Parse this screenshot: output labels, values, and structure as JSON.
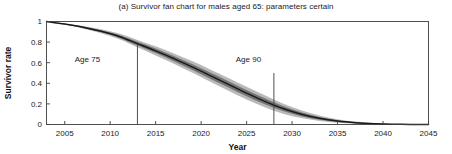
{
  "chart_data": {
    "type": "area",
    "title": "(a) Survivor fan chart for males aged 65: parameters certain",
    "xlabel": "Year",
    "ylabel": "Survivor rate",
    "xlim": [
      2003,
      2045
    ],
    "ylim": [
      0,
      1
    ],
    "grid": false,
    "legend_position": "none",
    "xticks": [
      2005,
      2010,
      2015,
      2020,
      2025,
      2030,
      2035,
      2040,
      2045
    ],
    "xtick_labels": [
      "2005",
      "2010",
      "2015",
      "2020",
      "2025",
      "2030",
      "2035",
      "2040",
      "2045"
    ],
    "yticks": [
      0,
      0.2,
      0.4,
      0.6,
      0.8,
      1
    ],
    "ytick_labels": [
      "0",
      "0.2",
      "0.4",
      "0.6",
      "0.8",
      "1"
    ],
    "x": [
      2003,
      2005,
      2007,
      2009,
      2011,
      2013,
      2015,
      2017,
      2019,
      2021,
      2023,
      2025,
      2027,
      2029,
      2031,
      2033,
      2035,
      2037,
      2039,
      2041,
      2043,
      2045
    ],
    "series": [
      {
        "name": "median survivor rate",
        "values": [
          1.0,
          0.975,
          0.945,
          0.905,
          0.855,
          0.785,
          0.715,
          0.64,
          0.56,
          0.475,
          0.39,
          0.305,
          0.225,
          0.155,
          0.1,
          0.06,
          0.033,
          0.017,
          0.008,
          0.003,
          0.001,
          0.0
        ]
      },
      {
        "name": "fan band inner upper",
        "values": [
          1.0,
          0.977,
          0.951,
          0.915,
          0.869,
          0.803,
          0.737,
          0.665,
          0.588,
          0.505,
          0.421,
          0.336,
          0.254,
          0.18,
          0.119,
          0.073,
          0.042,
          0.022,
          0.011,
          0.004,
          0.001,
          0.0
        ]
      },
      {
        "name": "fan band inner lower",
        "values": [
          1.0,
          0.973,
          0.939,
          0.895,
          0.841,
          0.767,
          0.693,
          0.615,
          0.532,
          0.445,
          0.359,
          0.274,
          0.196,
          0.13,
          0.081,
          0.047,
          0.024,
          0.012,
          0.005,
          0.002,
          0.0,
          0.0
        ]
      },
      {
        "name": "fan band outer upper",
        "values": [
          1.0,
          0.979,
          0.957,
          0.925,
          0.883,
          0.821,
          0.759,
          0.69,
          0.616,
          0.535,
          0.452,
          0.367,
          0.283,
          0.205,
          0.139,
          0.088,
          0.052,
          0.028,
          0.014,
          0.006,
          0.002,
          0.0
        ]
      },
      {
        "name": "fan band outer lower",
        "values": [
          1.0,
          0.971,
          0.933,
          0.885,
          0.827,
          0.749,
          0.671,
          0.59,
          0.504,
          0.415,
          0.328,
          0.243,
          0.167,
          0.105,
          0.062,
          0.034,
          0.017,
          0.008,
          0.003,
          0.001,
          0.0,
          0.0
        ]
      }
    ],
    "annotations": [
      {
        "text": "Age 75",
        "x": 2007.5,
        "y": 0.61,
        "reference_line_x": 2013,
        "reference_line_y_top": 0.785
      },
      {
        "text": "Age 90",
        "x": 2025.2,
        "y": 0.61,
        "reference_line_x": 2028,
        "reference_line_y_top": 0.5
      }
    ],
    "colors": {
      "median_line": "#1a1a1a",
      "band_inner": "#6e6e6e",
      "band_outer": "#b5b5b5",
      "axis": "#3d3d3d",
      "text": "#1a1a1a",
      "background": "#ffffff"
    }
  }
}
